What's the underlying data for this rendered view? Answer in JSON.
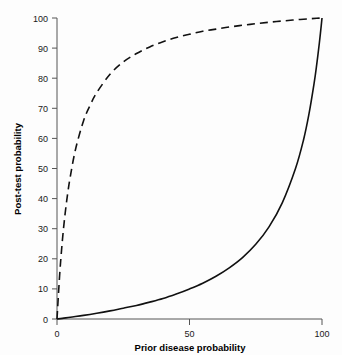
{
  "chart_data": {
    "type": "line",
    "title": "",
    "xlabel": "Prior disease probability",
    "ylabel": "Post-test probability",
    "xlim": [
      0,
      100
    ],
    "ylim": [
      0,
      100
    ],
    "xticks": [
      0,
      50,
      100
    ],
    "yticks": [
      0,
      10,
      20,
      30,
      40,
      50,
      60,
      70,
      80,
      90,
      100
    ],
    "xticklabels": [
      "0",
      "50",
      "100"
    ],
    "yticklabels": [
      "0",
      "10",
      "20",
      "30",
      "40",
      "50",
      "60",
      "70",
      "80",
      "90",
      "100"
    ],
    "grid": false,
    "legend": "none",
    "series": [
      {
        "name": "Positive test result",
        "style": "dashed",
        "color": "#111111",
        "x": [
          0,
          1,
          2,
          3,
          4,
          5,
          7,
          10,
          12.5,
          15,
          20,
          25,
          30,
          35,
          40,
          45,
          50,
          55,
          60,
          65,
          70,
          75,
          80,
          85,
          90,
          95,
          98,
          100
        ],
        "values": [
          0,
          14.6,
          25.8,
          34.5,
          41.5,
          47.2,
          56.4,
          65.8,
          71.0,
          75.2,
          81.3,
          85.4,
          88.2,
          90.4,
          92.1,
          93.5,
          94.6,
          95.6,
          96.3,
          97.0,
          97.6,
          98.1,
          98.6,
          99.0,
          99.4,
          99.7,
          99.9,
          100
        ],
        "note": "Post-test probability after a positive test (positive likelihood ratio approximately 17)"
      },
      {
        "name": "Negative test result",
        "style": "solid",
        "color": "#111111",
        "x": [
          0,
          2,
          5,
          10,
          15,
          20,
          25,
          30,
          35,
          40,
          45,
          50,
          55,
          60,
          65,
          70,
          75,
          80,
          85,
          90,
          93,
          95,
          97,
          98,
          99,
          99.5,
          100
        ],
        "values": [
          0,
          0.2,
          0.6,
          1.2,
          1.9,
          2.7,
          3.6,
          4.5,
          5.6,
          6.8,
          8.3,
          10.0,
          11.9,
          14.2,
          17.0,
          20.4,
          24.8,
          30.6,
          38.6,
          50.0,
          59.4,
          67.7,
          78.2,
          84.5,
          91.7,
          95.7,
          100
        ],
        "note": "Post-test probability after a negative test (negative likelihood ratio approximately 0.11)"
      }
    ]
  }
}
